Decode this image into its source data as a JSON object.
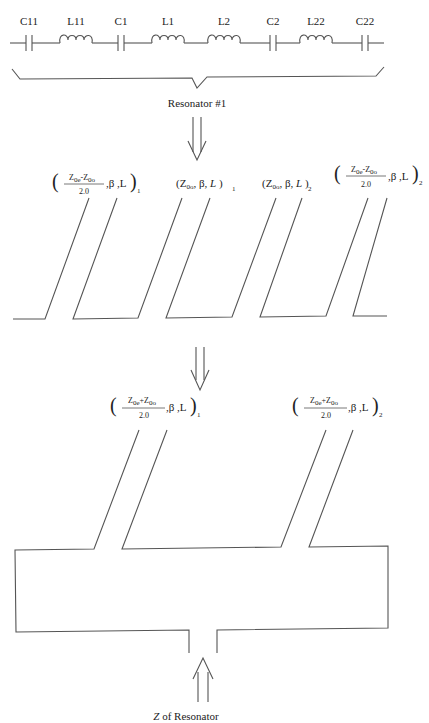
{
  "circuit": {
    "components": [
      {
        "type": "capacitor",
        "label": "C11"
      },
      {
        "type": "inductor",
        "label": "L11"
      },
      {
        "type": "capacitor",
        "label": "C1"
      },
      {
        "type": "inductor",
        "label": "L1"
      },
      {
        "type": "inductor",
        "label": "L2"
      },
      {
        "type": "capacitor",
        "label": "C2"
      },
      {
        "type": "inductor",
        "label": "L22"
      },
      {
        "type": "capacitor",
        "label": "C22"
      }
    ],
    "brace_label": "Resonator #1"
  },
  "coupled_lines": {
    "labels": [
      {
        "numerator": "Z0e-Z0o",
        "denominator": "2.0",
        "params": ",β ,L",
        "subscript": "1"
      },
      {
        "text": "(Z0o, β, L )",
        "subscript": "1"
      },
      {
        "text": "(Z0o, β, L )",
        "subscript": "2"
      },
      {
        "numerator": "Z0e-Z0o",
        "denominator": "2.0",
        "params": ",β ,L",
        "subscript": "2"
      }
    ]
  },
  "equivalent": {
    "labels": [
      {
        "numerator": "Z0e+Z0o",
        "denominator": "2.0",
        "params": ",β ,L",
        "subscript": "1"
      },
      {
        "numerator": "Z0e+Z0o",
        "denominator": "2.0",
        "params": ",β ,L",
        "subscript": "2"
      }
    ],
    "input_label_italic": "Z",
    "input_label_rest": " of Resonator"
  },
  "colors": {
    "line": "#555555",
    "text": "#222222",
    "background": "#ffffff"
  }
}
